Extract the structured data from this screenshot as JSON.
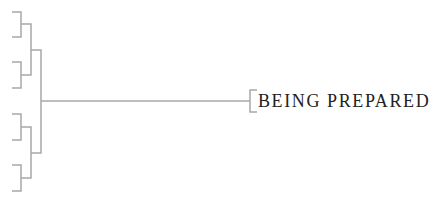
{
  "diagram": {
    "type": "bracket-tree",
    "line_color": "#a8a8a8",
    "text_color": "#222222",
    "leaves": 8,
    "final_label": "BEING PREPARED"
  }
}
